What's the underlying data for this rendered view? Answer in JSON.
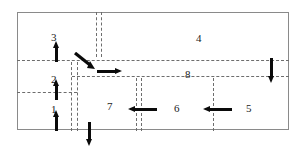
{
  "figure": {
    "kind": "intersection-lane-diagram",
    "frame": {
      "x": 17,
      "y": 12,
      "w": 272,
      "h": 118,
      "border_color": "#8a8a8a"
    },
    "marking_color": "#6d6d6d",
    "arrow_color": "#0a0a0a"
  },
  "labels": [
    {
      "id": "label-1",
      "text": "1",
      "x": 51,
      "y": 104
    },
    {
      "id": "label-2",
      "text": "2",
      "x": 51,
      "y": 74
    },
    {
      "id": "label-3",
      "text": "3",
      "x": 51,
      "y": 32
    },
    {
      "id": "label-4",
      "text": "4",
      "x": 196,
      "y": 33
    },
    {
      "id": "label-5",
      "text": "5",
      "x": 246,
      "y": 103
    },
    {
      "id": "label-6",
      "text": "6",
      "x": 174,
      "y": 103
    },
    {
      "id": "label-7",
      "text": "7",
      "x": 107,
      "y": 101
    },
    {
      "id": "label-8",
      "text": "8",
      "x": 185,
      "y": 69
    }
  ],
  "lane_markings": {
    "horizontal": [
      {
        "id": "hline-top-major",
        "x": 17,
        "y": 60,
        "length": 272
      },
      {
        "id": "hline-mid-right",
        "x": 72,
        "y": 76,
        "length": 217
      },
      {
        "id": "hline-lower-left",
        "x": 17,
        "y": 92,
        "length": 60
      }
    ],
    "vertical": [
      {
        "id": "vline-north-west",
        "x": 96,
        "y": 12,
        "length": 45
      },
      {
        "id": "vline-north-east",
        "x": 101,
        "y": 12,
        "length": 45
      },
      {
        "id": "vline-west-a",
        "x": 71,
        "y": 62,
        "length": 69
      },
      {
        "id": "vline-west-b",
        "x": 77,
        "y": 62,
        "length": 69
      },
      {
        "id": "vline-mid-a",
        "x": 136,
        "y": 78,
        "length": 53
      },
      {
        "id": "vline-mid-b",
        "x": 141,
        "y": 78,
        "length": 53
      },
      {
        "id": "vline-east",
        "x": 213,
        "y": 78,
        "length": 53
      }
    ]
  },
  "arrows": [
    {
      "id": "arrow-up-lane-3",
      "direction": "up",
      "x": 53,
      "y": 41,
      "length": 21
    },
    {
      "id": "arrow-up-lane-2",
      "direction": "up",
      "x": 53,
      "y": 79,
      "length": 21
    },
    {
      "id": "arrow-up-lane-1",
      "direction": "up",
      "x": 53,
      "y": 110,
      "length": 21
    },
    {
      "id": "arrow-down-south",
      "direction": "down",
      "x": 86,
      "y": 122,
      "length": 24
    },
    {
      "id": "arrow-down-east",
      "direction": "down",
      "x": 268,
      "y": 58,
      "length": 25
    },
    {
      "id": "arrow-right-turn",
      "direction": "right",
      "x": 97,
      "y": 68,
      "length": 25
    },
    {
      "id": "arrow-left-lane-6",
      "direction": "left",
      "x": 128,
      "y": 106,
      "length": 29
    },
    {
      "id": "arrow-left-lane-5",
      "direction": "left",
      "x": 203,
      "y": 106,
      "length": 29
    },
    {
      "id": "arrow-diagonal-merge",
      "direction": "diagonal-down-right",
      "x": 74,
      "y": 54,
      "length": 24
    }
  ]
}
